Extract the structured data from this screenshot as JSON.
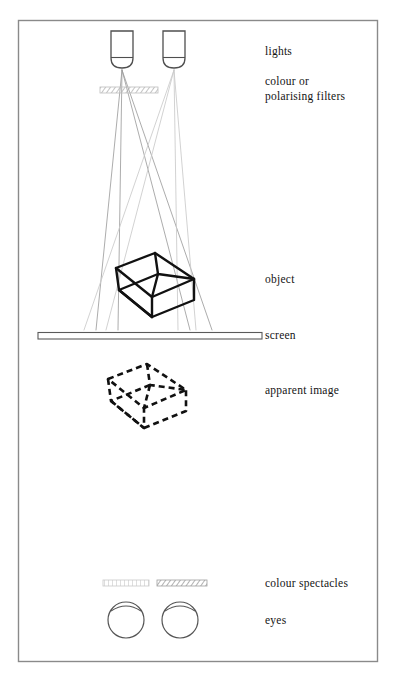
{
  "figure": {
    "frame": {
      "color": "#8a8a8a",
      "x": 18,
      "y": 20,
      "width": 360,
      "height": 642
    }
  },
  "labels": {
    "lights": "lights",
    "filters": "colour or\npolarising filters",
    "object": "object",
    "screen": "screen",
    "apparent_image": "apparent image",
    "spectacles": "colour spectacles",
    "eyes": "eyes"
  },
  "colors": {
    "ink": "#141414",
    "outline": "#4a4a4a",
    "frame": "#8a8a8a",
    "ray_left": "#9a9a9a",
    "ray_right": "#c9c9c9",
    "hatch": "#a8a8a8",
    "paper": "#ffffff"
  },
  "elements": {
    "lamps": [
      {
        "name": "lamp-left",
        "x": 111,
        "y": 31,
        "width": 22,
        "height": 37
      },
      {
        "name": "lamp-right",
        "x": 163,
        "y": 31,
        "width": 22,
        "height": 37
      }
    ],
    "projection_filter": {
      "x": 100,
      "y": 87,
      "width": 58,
      "height": 6,
      "pattern": "diagonal-hatch"
    },
    "object_cube": {
      "center_x": 155,
      "center_y": 285,
      "style": "solid",
      "note": "wireframe cube, oblique view"
    },
    "screen_bar": {
      "x": 38,
      "y": 332,
      "width": 224,
      "height": 7
    },
    "apparent_cube": {
      "center_x": 146,
      "center_y": 396,
      "style": "dashed",
      "note": "wireframe cube, dashed"
    },
    "spectacle_filters": [
      {
        "name": "spectacle-filter-left",
        "x": 103,
        "y": 580,
        "width": 46,
        "height": 6,
        "pattern": "vertical-lines"
      },
      {
        "name": "spectacle-filter-right",
        "x": 157,
        "y": 580,
        "width": 50,
        "height": 6,
        "pattern": "diagonal-hatch"
      }
    ],
    "eyes": [
      {
        "name": "eye-left",
        "cx": 126,
        "cy": 620,
        "r": 18
      },
      {
        "name": "eye-right",
        "cx": 180,
        "cy": 620,
        "r": 18
      }
    ]
  }
}
